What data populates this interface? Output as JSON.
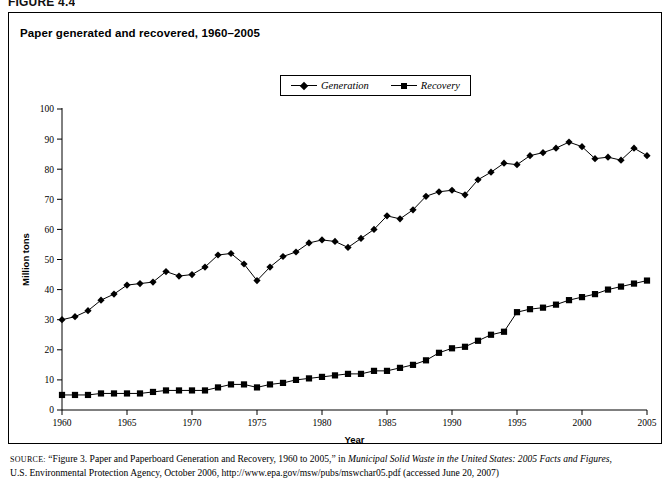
{
  "figure": {
    "number": "FIGURE 4.4"
  },
  "panel": {
    "title": "Paper generated and recovered, 1960–2005"
  },
  "legend": {
    "position": "top-center",
    "entries": [
      {
        "label": "Generation",
        "marker": "diamond-marker",
        "color": "#000000"
      },
      {
        "label": "Recovery",
        "marker": "square-marker",
        "color": "#000000"
      }
    ]
  },
  "source": {
    "label": "SOURCE:",
    "line1_pre": " “Figure 3. Paper and Paperboard Generation and Recovery, 1960 to 2005,” in ",
    "line1_italic": "Municipal Solid Waste in the United States: 2005 Facts and Figures,",
    "line2": "U.S. Environmental Protection Agency, October 2006, http://www.epa.gov/msw/pubs/mswchar05.pdf (accessed June 20, 2007)"
  },
  "chart_data": {
    "type": "line",
    "title": "Paper generated and recovered, 1960–2005",
    "xlabel": "Year",
    "ylabel": "Million tons",
    "xlim": [
      1960,
      2005
    ],
    "ylim": [
      0,
      100
    ],
    "ytick_step": 10,
    "xtick_step": 5,
    "xticks": [
      1960,
      1965,
      1970,
      1975,
      1980,
      1985,
      1990,
      1995,
      2000,
      2005
    ],
    "yticks": [
      0,
      10,
      20,
      30,
      40,
      50,
      60,
      70,
      80,
      90,
      100
    ],
    "grid": false,
    "legend": "top-center",
    "x": [
      1960,
      1961,
      1962,
      1963,
      1964,
      1965,
      1966,
      1967,
      1968,
      1969,
      1970,
      1971,
      1972,
      1973,
      1974,
      1975,
      1976,
      1977,
      1978,
      1979,
      1980,
      1981,
      1982,
      1983,
      1984,
      1985,
      1986,
      1987,
      1988,
      1989,
      1990,
      1991,
      1992,
      1993,
      1994,
      1995,
      1996,
      1997,
      1998,
      1999,
      2000,
      2001,
      2002,
      2003,
      2004,
      2005
    ],
    "series": [
      {
        "name": "Generation",
        "marker": "diamond",
        "color": "#000000",
        "values": [
          30.0,
          31.0,
          33.0,
          36.5,
          38.5,
          41.5,
          42.0,
          42.5,
          46.0,
          44.5,
          45.0,
          47.5,
          51.5,
          52.0,
          48.5,
          43.0,
          47.5,
          51.0,
          52.5,
          55.5,
          56.5,
          56.0,
          54.0,
          57.0,
          60.0,
          64.5,
          63.5,
          66.5,
          71.0,
          72.5,
          73.0,
          71.5,
          76.5,
          79.0,
          82.0,
          81.5,
          84.5,
          85.5,
          87.0,
          89.0,
          87.5,
          83.5,
          84.0,
          83.0,
          87.0,
          84.5
        ]
      },
      {
        "name": "Recovery",
        "marker": "square",
        "color": "#000000",
        "values": [
          5.0,
          5.0,
          5.0,
          5.5,
          5.5,
          5.5,
          5.5,
          6.0,
          6.5,
          6.5,
          6.5,
          6.5,
          7.5,
          8.5,
          8.5,
          7.5,
          8.5,
          9.0,
          10.0,
          10.5,
          11.0,
          11.5,
          12.0,
          12.0,
          13.0,
          13.0,
          14.0,
          15.0,
          16.5,
          19.0,
          20.5,
          21.0,
          23.0,
          25.0,
          26.0,
          32.5,
          33.5,
          34.0,
          35.0,
          36.5,
          37.5,
          38.5,
          40.0,
          41.0,
          42.0,
          43.0
        ]
      }
    ]
  }
}
